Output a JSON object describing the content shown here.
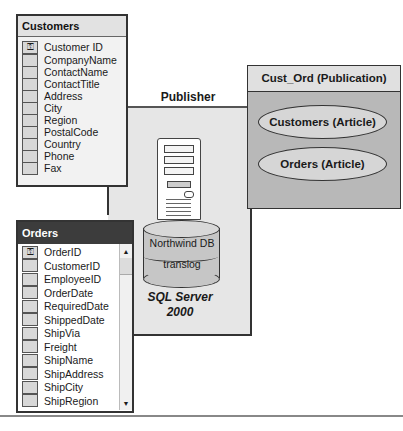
{
  "publisher": {
    "label": "Publisher"
  },
  "server": {
    "databases": {
      "db_label": "Northwind DB",
      "log_label": "translog"
    },
    "name_line1": "SQL Server",
    "name_line2": "2000"
  },
  "publication": {
    "title": "Cust_Ord (Publication)",
    "articles": [
      {
        "label": "Customers (Article)"
      },
      {
        "label": "Orders (Article)"
      }
    ]
  },
  "customers_table": {
    "title": "Customers",
    "key_icon": "key-icon",
    "columns": [
      "Customer ID",
      "CompanyName",
      "ContactName",
      "ContactTitle",
      "Address",
      "City",
      "Region",
      "PostalCode",
      "Country",
      "Phone",
      "Fax"
    ]
  },
  "orders_table": {
    "title": "Orders",
    "key_icon": "key-icon",
    "scroll_up": "▲",
    "scroll_down": "▼",
    "columns": [
      "OrderID",
      "CustomerID",
      "EmployeeID",
      "OrderDate",
      "RequiredDate",
      "ShippedDate",
      "ShipVia",
      "Freight",
      "ShipName",
      "ShipAddress",
      "ShipCity",
      "ShipRegion"
    ]
  },
  "colors": {
    "publisher_bg": "#e6e6e6",
    "publication_bg": "#b8b8b8",
    "orders_header": "#3c3c3c"
  }
}
